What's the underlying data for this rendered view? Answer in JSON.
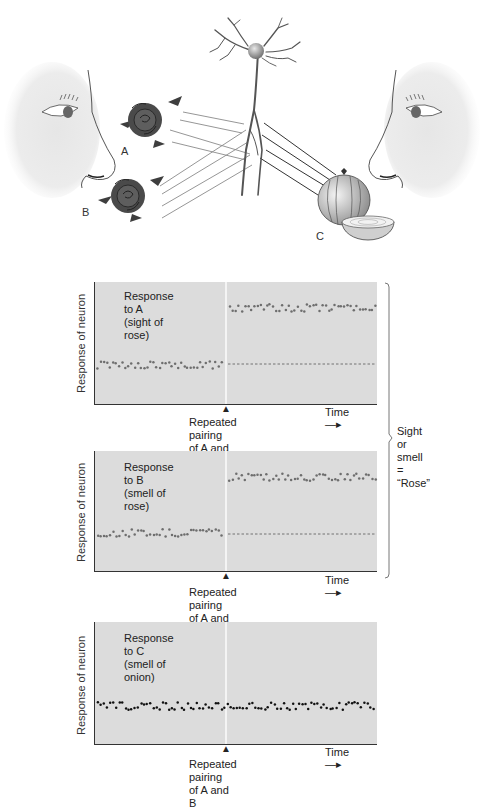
{
  "illustration": {
    "labels": {
      "a": "A",
      "b": "B",
      "c": "C"
    },
    "elements": [
      "left-face",
      "rose-a",
      "rose-b",
      "neuron",
      "onion-c",
      "right-face"
    ]
  },
  "panels": [
    {
      "id": "a",
      "title_line1": "Response to A",
      "title_line2": "(sight of rose)",
      "ylabel": "Response of neuron",
      "xlabel": "Time",
      "pairing_line1": "Repeated pairing",
      "pairing_line2": "of A and B",
      "dot_color": "#6e6e6e"
    },
    {
      "id": "b",
      "title_line1": "Response to B",
      "title_line2": "(smell of rose)",
      "ylabel": "Response of neuron",
      "xlabel": "Time",
      "pairing_line1": "Repeated pairing",
      "pairing_line2": "of A and B",
      "dot_color": "#6e6e6e"
    },
    {
      "id": "c",
      "title_line1": "Response to C",
      "title_line2": "(smell of onion)",
      "ylabel": "Response of neuron",
      "xlabel": "Time",
      "pairing_line1": "Repeated pairing",
      "pairing_line2": "of A and B",
      "dot_color": "#111111"
    }
  ],
  "brace": {
    "line1": "Sight or smell",
    "line2": "= “Rose”"
  },
  "chart_data": [
    {
      "type": "scatter",
      "title": "Response to A (sight of rose)",
      "xlabel": "Time",
      "ylabel": "Response of neuron",
      "annotation": "Repeated pairing of A and B",
      "series": [
        {
          "name": "before pairing",
          "level": "baseline (low)"
        },
        {
          "name": "after pairing",
          "level": "elevated (high)"
        },
        {
          "name": "baseline reference",
          "style": "dashed",
          "level": "baseline (low)"
        }
      ]
    },
    {
      "type": "scatter",
      "title": "Response to B (smell of rose)",
      "xlabel": "Time",
      "ylabel": "Response of neuron",
      "annotation": "Repeated pairing of A and B",
      "series": [
        {
          "name": "before pairing",
          "level": "baseline (low)"
        },
        {
          "name": "after pairing",
          "level": "elevated (high)"
        },
        {
          "name": "baseline reference",
          "style": "dashed",
          "level": "baseline (low)"
        }
      ]
    },
    {
      "type": "scatter",
      "title": "Response to C (smell of onion)",
      "xlabel": "Time",
      "ylabel": "Response of neuron",
      "annotation": "Repeated pairing of A and B",
      "series": [
        {
          "name": "before and after pairing",
          "level": "baseline (unchanged)"
        }
      ]
    }
  ]
}
